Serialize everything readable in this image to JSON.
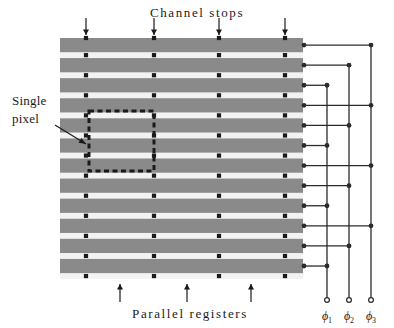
{
  "figure": {
    "kind": "ccd-parallel-register-diagram",
    "width": 394,
    "height": 328
  },
  "colors": {
    "register_gray": "#8a8a8a",
    "gap_white": "#f2f2f2",
    "ink": "#1a1a1a",
    "wire": "#2b2b2b",
    "background": "#ffffff"
  },
  "labels": {
    "channel_stops": "Channel stops",
    "parallel_registers": "Parallel registers",
    "single_pixel_line1": "Single",
    "single_pixel_line2": "pixel"
  },
  "phases": [
    {
      "name": "phi-1",
      "symbol": "ϕ",
      "subscript": "1",
      "bus_x": 327
    },
    {
      "name": "phi-2",
      "symbol": "ϕ",
      "subscript": "2",
      "bus_x": 349
    },
    {
      "name": "phi-3",
      "symbol": "ϕ",
      "subscript": "3",
      "bus_x": 371
    }
  ],
  "grid": {
    "left": 60,
    "right": 303,
    "top": 38,
    "bottom": 279,
    "bar_count": 12,
    "bar_height": 14.2,
    "gap_height": 5.9,
    "channel_stop_columns": [
      86,
      154,
      219,
      285
    ]
  },
  "bars": [
    {
      "index": 0,
      "phase": "phi-3"
    },
    {
      "index": 1,
      "phase": "phi-2"
    },
    {
      "index": 2,
      "phase": "phi-1"
    },
    {
      "index": 3,
      "phase": "phi-3"
    },
    {
      "index": 4,
      "phase": "phi-2"
    },
    {
      "index": 5,
      "phase": "phi-1"
    },
    {
      "index": 6,
      "phase": "phi-3"
    },
    {
      "index": 7,
      "phase": "phi-2"
    },
    {
      "index": 8,
      "phase": "phi-1"
    },
    {
      "index": 9,
      "phase": "phi-3"
    },
    {
      "index": 10,
      "phase": "phi-2"
    },
    {
      "index": 11,
      "phase": "phi-1"
    }
  ],
  "top_arrows": {
    "x_positions": [
      86,
      154,
      219,
      285
    ],
    "y_top": 18,
    "y_bottom": 35
  },
  "bottom_arrows": {
    "x_positions": [
      120,
      187,
      251
    ],
    "y_top": 284,
    "y_bottom": 302
  },
  "single_pixel_box": {
    "x": 89,
    "y": 111,
    "width": 65,
    "height": 60
  },
  "callout": {
    "text_x": 12,
    "text_y1": 105,
    "text_y2": 123,
    "leader_from_x": 55,
    "leader_from_y": 125,
    "leader_to_x": 86,
    "leader_to_y": 144
  },
  "bus": {
    "terminal_y": 300,
    "terminal_radius": 2.4,
    "label_y": 320
  }
}
